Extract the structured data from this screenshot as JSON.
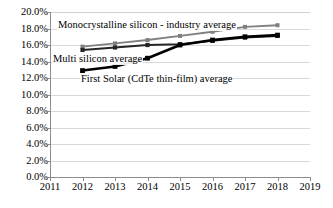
{
  "chart_data": {
    "type": "line",
    "title": "",
    "xlabel": "",
    "ylabel": "",
    "x": [
      2012,
      2013,
      2014,
      2015,
      2016,
      2017,
      2018
    ],
    "x_tick_labels": [
      "2011",
      "2012",
      "2013",
      "2014",
      "2015",
      "2016",
      "2017",
      "2018",
      "2019"
    ],
    "y_tick_labels": [
      "0.0%",
      "2.0%",
      "4.0%",
      "6.0%",
      "8.0%",
      "10.0%",
      "12.0%",
      "14.0%",
      "16.0%",
      "18.0%",
      "20.0%"
    ],
    "y_tick_values": [
      0.0,
      2.0,
      4.0,
      6.0,
      8.0,
      10.0,
      12.0,
      14.0,
      16.0,
      18.0,
      20.0
    ],
    "xlim": [
      2011,
      2019
    ],
    "ylim": [
      0.0,
      20.0
    ],
    "grid": true,
    "legend_position": "inline-annotations",
    "series": [
      {
        "name": "Monocrystalline silicon - industry average",
        "color": "#808080",
        "values": [
          15.8,
          16.2,
          16.6,
          17.1,
          17.6,
          18.2,
          18.4
        ]
      },
      {
        "name": "Multi silicon average",
        "color": "#262626",
        "values": [
          15.4,
          15.7,
          16.0,
          16.1,
          16.5,
          16.9,
          17.1
        ]
      },
      {
        "name": "First Solar (CdTe thin-film) average",
        "color": "#000000",
        "values": [
          12.9,
          13.4,
          14.4,
          16.0,
          16.6,
          17.0,
          17.2
        ]
      }
    ],
    "annotations": [
      {
        "text": "Monocrystalline silicon - industry average",
        "series": "Monocrystalline silicon - industry average"
      },
      {
        "text": "Multi silicon average",
        "series": "Multi silicon average"
      },
      {
        "text": "First Solar (CdTe thin-film) average",
        "series": "First Solar (CdTe thin-film) average"
      }
    ]
  },
  "colors": {
    "grid": "#d9d9d9",
    "axis": "#8c8c8c",
    "background": "#ffffff",
    "text": "#000000"
  }
}
